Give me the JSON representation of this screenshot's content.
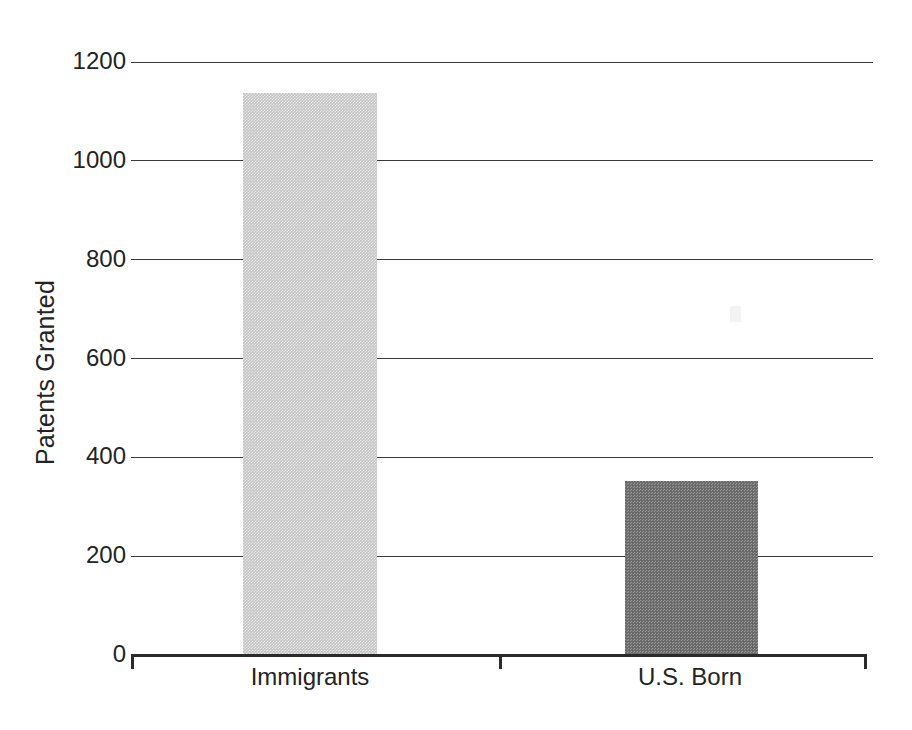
{
  "chart_data": {
    "type": "bar",
    "title": "",
    "subtitle": "",
    "xlabel": "",
    "ylabel": "Patents Granted",
    "categories": [
      "Immigrants",
      "U.S. Born"
    ],
    "values": [
      1137,
      352
    ],
    "series": [
      {
        "name": "Patents Granted",
        "values": [
          1137,
          352
        ]
      }
    ],
    "ylim": [
      0,
      1200
    ],
    "yticks": [
      0,
      200,
      400,
      600,
      800,
      1000,
      1200
    ],
    "ytick_labels": [
      "0",
      "200",
      "400",
      "600",
      "800",
      "1000",
      "1200"
    ],
    "grid": true,
    "grid_axis": "y",
    "legend": false,
    "legend_position": "none",
    "annotations": [],
    "bar_colors": [
      "#c3c3c3",
      "#6f6f6f"
    ],
    "bar_fill_style": "dithered-halftone",
    "axis_color": "#2b2b2b",
    "gridline_color": "#3a3a3a",
    "background_color": "#ffffff",
    "text_color": "#232323"
  },
  "axes": {
    "y_title": "Patents Granted",
    "ticks": [
      {
        "label": "1200",
        "value": 1200
      },
      {
        "label": "1000",
        "value": 1000
      },
      {
        "label": "800",
        "value": 800
      },
      {
        "label": "600",
        "value": 600
      },
      {
        "label": "400",
        "value": 400
      },
      {
        "label": "200",
        "value": 200
      },
      {
        "label": "0",
        "value": 0
      }
    ]
  },
  "bars": [
    {
      "label": "Immigrants",
      "value": 1137,
      "color": "#c3c3c3"
    },
    {
      "label": "U.S. Born",
      "value": 352,
      "color": "#6f6f6f"
    }
  ]
}
